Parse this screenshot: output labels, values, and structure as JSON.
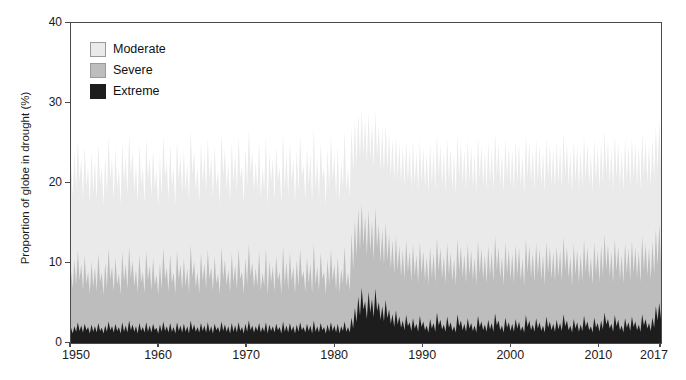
{
  "chart_data": {
    "type": "area",
    "title": "",
    "subtitle": "",
    "xlabel": "",
    "ylabel": "Proportion of globe in drought (%)",
    "xlim": [
      1950,
      2017
    ],
    "ylim": [
      0,
      40
    ],
    "grid": false,
    "legend_position": "top-left inside",
    "stacked": true,
    "yticks": [
      0,
      10,
      20,
      30,
      40
    ],
    "ytick_labels": [
      "0",
      "10",
      "20",
      "30",
      "40"
    ],
    "xticks": [
      1950,
      1960,
      1970,
      1980,
      1990,
      2000,
      2010,
      2017
    ],
    "xtick_labels": [
      "1950",
      "1960",
      "1970",
      "1980",
      "1990",
      "2000",
      "2010",
      "2017"
    ],
    "colors": {
      "moderate": "#eaeaea",
      "severe": "#bdbdbd",
      "extreme": "#1d1d1d",
      "axis": "#4a4a4a",
      "text": "#1a1a1a",
      "background": "#ffffff"
    },
    "legend": [
      {
        "label": "Moderate",
        "color": "#eaeaea"
      },
      {
        "label": "Severe",
        "color": "#bdbdbd"
      },
      {
        "label": "Extreme",
        "color": "#1d1d1d"
      }
    ],
    "series": [
      {
        "name": "Extreme",
        "color": "#1d1d1d",
        "values": [
          1.9,
          1.2,
          2.1,
          1.4,
          2.6,
          1.5,
          2.2,
          1.3,
          2.4,
          1.6,
          2.0,
          1.2,
          2.3,
          1.4,
          2.1,
          1.3,
          2.5,
          1.5,
          1.9,
          1.2,
          2.2,
          1.4,
          2.7,
          1.6,
          2.1,
          1.3,
          2.4,
          1.5,
          2.0,
          1.2,
          2.6,
          1.4,
          2.2,
          1.3,
          2.8,
          1.6,
          2.3,
          1.4,
          2.1,
          1.2,
          2.5,
          1.5,
          2.0,
          1.3,
          2.6,
          1.4,
          2.2,
          1.3,
          2.4,
          1.6,
          1.9,
          1.2,
          2.3,
          1.4,
          2.7,
          1.5,
          2.1,
          1.3,
          2.5,
          1.4,
          2.0,
          1.2,
          2.6,
          1.5,
          2.2,
          1.3,
          2.4,
          1.4,
          2.1,
          1.2,
          2.8,
          1.6,
          2.3,
          1.4,
          2.0,
          1.3,
          2.5,
          1.5,
          2.2,
          1.3,
          2.6,
          1.4,
          2.1,
          1.2,
          2.4,
          1.6,
          2.0,
          1.3,
          2.7,
          1.5,
          2.3,
          1.4,
          2.1,
          1.2,
          2.5,
          1.4,
          2.2,
          1.3,
          2.6,
          1.5,
          2.0,
          1.2,
          2.4,
          1.4,
          2.8,
          1.6,
          2.2,
          1.3,
          2.1,
          1.5,
          2.5,
          1.3,
          2.0,
          1.4,
          2.6,
          1.2,
          2.3,
          1.5,
          2.1,
          1.3,
          2.4,
          1.6,
          2.0,
          1.2,
          2.7,
          1.4,
          2.2,
          1.3,
          2.5,
          1.5,
          2.1,
          1.2,
          2.3,
          1.4,
          2.6,
          1.6,
          2.0,
          1.3,
          2.4,
          1.5,
          2.2,
          1.2,
          2.8,
          1.4,
          2.1,
          1.3,
          2.5,
          1.6,
          2.0,
          1.2,
          2.3,
          1.4,
          2.6,
          1.5,
          2.2,
          1.3,
          2.4,
          1.2,
          2.1,
          1.5,
          2.7,
          1.4,
          2.0,
          1.3,
          3.2,
          1.8,
          4.4,
          2.6,
          5.8,
          3.4,
          6.9,
          4.2,
          5.2,
          3.0,
          6.4,
          3.8,
          5.5,
          3.2,
          6.8,
          4.0,
          5.1,
          2.9,
          4.6,
          2.7,
          5.4,
          3.1,
          4.2,
          2.4,
          3.6,
          2.0,
          4.1,
          2.3,
          3.3,
          1.9,
          2.8,
          1.6,
          3.5,
          2.1,
          2.6,
          1.5,
          3.1,
          1.8,
          2.4,
          1.4,
          3.4,
          2.0,
          2.7,
          1.6,
          2.2,
          1.3,
          3.0,
          1.8,
          2.5,
          1.4,
          3.8,
          2.2,
          2.9,
          1.7,
          2.3,
          1.4,
          3.3,
          1.9,
          2.6,
          1.5,
          2.1,
          1.3,
          3.6,
          2.1,
          2.8,
          1.6,
          2.4,
          1.4,
          3.1,
          1.8,
          2.5,
          1.5,
          2.2,
          1.3,
          3.4,
          2.0,
          2.7,
          1.6,
          2.3,
          1.4,
          2.9,
          1.7,
          2.5,
          1.4,
          3.7,
          2.2,
          2.8,
          1.6,
          2.2,
          1.3,
          3.2,
          1.9,
          2.6,
          1.5,
          2.4,
          1.4,
          3.0,
          1.8,
          2.7,
          1.5,
          2.1,
          1.3,
          3.5,
          2.0,
          2.8,
          1.6,
          2.3,
          1.4,
          3.1,
          1.8,
          2.6,
          1.5,
          2.2,
          1.3,
          3.3,
          1.9,
          2.7,
          1.6,
          2.4,
          1.4,
          2.9,
          1.7,
          2.5,
          1.5,
          3.6,
          2.1,
          2.8,
          1.6,
          2.2,
          1.3,
          3.0,
          1.8,
          2.6,
          1.4,
          2.3,
          1.5,
          3.4,
          2.0,
          2.7,
          1.6,
          2.1,
          1.3,
          3.2,
          1.9,
          2.5,
          1.4,
          2.8,
          1.7,
          3.8,
          2.3,
          3.0,
          1.8,
          2.4,
          1.4,
          3.5,
          2.1,
          2.9,
          1.6,
          2.2,
          1.3,
          3.1,
          1.9,
          2.6,
          1.5,
          3.3,
          2.0,
          2.7,
          1.6,
          2.3,
          1.4,
          3.6,
          2.2,
          3.0,
          1.8,
          2.5,
          1.5,
          3.2,
          1.9,
          4.6,
          2.8,
          5.0,
          3.0
        ]
      },
      {
        "name": "Severe",
        "color": "#bdbdbd",
        "values": [
          9.1,
          6.8,
          10.4,
          7.2,
          11.6,
          7.8,
          9.8,
          6.6,
          10.9,
          7.4,
          8.9,
          6.2,
          10.2,
          7.0,
          9.5,
          6.5,
          11.2,
          7.6,
          8.8,
          6.0,
          10.1,
          6.9,
          11.8,
          7.9,
          9.6,
          6.4,
          10.7,
          7.3,
          8.7,
          6.1,
          11.4,
          7.7,
          9.9,
          6.7,
          12.1,
          8.1,
          10.3,
          7.1,
          9.2,
          6.3,
          11.0,
          7.5,
          8.9,
          6.2,
          11.5,
          7.8,
          9.7,
          6.6,
          10.6,
          7.2,
          8.6,
          6.0,
          10.0,
          6.8,
          11.9,
          8.0,
          9.4,
          6.4,
          11.1,
          7.5,
          8.8,
          6.1,
          11.6,
          7.9,
          9.8,
          6.7,
          10.5,
          7.1,
          9.3,
          6.3,
          12.3,
          8.2,
          10.2,
          7.0,
          8.9,
          6.2,
          11.3,
          7.7,
          9.9,
          6.8,
          11.7,
          7.9,
          9.5,
          6.5,
          10.8,
          7.4,
          8.7,
          6.1,
          12.0,
          8.0,
          10.4,
          7.2,
          9.2,
          6.3,
          11.2,
          7.6,
          9.8,
          6.7,
          11.8,
          8.0,
          8.9,
          6.2,
          10.6,
          7.3,
          12.4,
          8.3,
          10.1,
          6.9,
          9.4,
          7.0,
          11.5,
          6.5,
          8.8,
          7.1,
          11.9,
          6.0,
          10.3,
          7.6,
          9.6,
          6.4,
          10.9,
          7.8,
          8.9,
          6.1,
          12.2,
          7.2,
          10.2,
          6.6,
          11.4,
          7.7,
          9.5,
          6.2,
          10.4,
          7.1,
          11.8,
          8.1,
          9.0,
          6.4,
          10.7,
          7.5,
          9.9,
          6.2,
          12.5,
          7.3,
          9.6,
          6.5,
          11.3,
          8.0,
          8.9,
          6.1,
          10.5,
          7.2,
          11.7,
          7.8,
          9.8,
          6.6,
          10.8,
          6.3,
          9.3,
          7.4,
          12.1,
          7.1,
          8.8,
          6.5,
          13.8,
          9.2,
          15.4,
          10.8,
          16.8,
          11.6,
          17.4,
          12.2,
          15.9,
          10.9,
          16.6,
          11.4,
          15.2,
          10.4,
          16.9,
          11.8,
          14.8,
          10.1,
          14.2,
          9.8,
          15.0,
          10.3,
          13.6,
          9.3,
          12.8,
          8.6,
          13.4,
          9.1,
          12.2,
          8.3,
          11.6,
          7.9,
          12.9,
          8.8,
          11.4,
          7.7,
          12.3,
          8.4,
          11.0,
          7.5,
          12.6,
          8.6,
          11.5,
          7.8,
          10.8,
          7.3,
          12.0,
          8.2,
          11.2,
          7.6,
          13.2,
          9.0,
          11.9,
          8.1,
          10.9,
          7.4,
          12.5,
          8.5,
          11.3,
          7.7,
          10.6,
          7.2,
          13.0,
          8.9,
          12.1,
          8.2,
          11.1,
          7.5,
          12.4,
          8.4,
          11.6,
          7.9,
          10.7,
          7.3,
          12.8,
          8.7,
          11.8,
          8.0,
          11.0,
          7.4,
          12.2,
          8.3,
          11.4,
          7.6,
          13.4,
          9.1,
          12.0,
          8.1,
          10.8,
          7.2,
          12.6,
          8.6,
          11.7,
          7.9,
          11.2,
          7.5,
          12.3,
          8.4,
          11.9,
          7.8,
          10.6,
          7.1,
          13.1,
          8.8,
          12.2,
          8.2,
          11.3,
          7.6,
          12.5,
          8.5,
          11.8,
          7.9,
          11.0,
          7.3,
          12.7,
          8.7,
          11.9,
          8.0,
          11.4,
          7.7,
          12.1,
          8.3,
          11.6,
          7.8,
          13.3,
          9.0,
          12.0,
          8.1,
          10.9,
          7.2,
          12.4,
          8.5,
          11.7,
          7.5,
          11.2,
          7.8,
          12.9,
          8.8,
          12.0,
          8.0,
          10.8,
          7.3,
          12.6,
          8.6,
          11.5,
          7.6,
          12.2,
          8.4,
          13.6,
          9.2,
          12.3,
          8.3,
          11.4,
          7.5,
          13.0,
          8.9,
          12.1,
          7.9,
          11.1,
          7.4,
          12.5,
          8.6,
          11.8,
          7.8,
          12.8,
          8.7,
          12.0,
          8.1,
          11.5,
          7.6,
          13.4,
          9.1,
          12.4,
          8.4,
          11.9,
          7.9,
          12.7,
          8.6,
          14.2,
          9.6,
          14.8,
          10.0
        ]
      },
      {
        "name": "Moderate",
        "color": "#eaeaea",
        "values": [
          22.6,
          18.4,
          24.1,
          19.2,
          25.4,
          20.1,
          23.2,
          18.0,
          24.6,
          19.6,
          22.1,
          17.4,
          23.9,
          18.8,
          22.8,
          17.8,
          25.0,
          19.8,
          21.9,
          17.2,
          23.6,
          18.6,
          25.8,
          20.4,
          23.0,
          17.9,
          24.4,
          19.4,
          21.8,
          17.3,
          25.2,
          20.0,
          23.4,
          18.5,
          26.2,
          20.8,
          24.0,
          19.0,
          22.4,
          17.6,
          24.8,
          19.7,
          22.0,
          17.4,
          25.6,
          20.2,
          23.3,
          18.3,
          24.3,
          19.3,
          21.6,
          17.1,
          23.5,
          18.4,
          26.0,
          20.6,
          22.7,
          17.8,
          24.9,
          19.6,
          21.9,
          17.2,
          25.5,
          20.3,
          23.6,
          18.7,
          24.2,
          19.1,
          22.6,
          17.7,
          26.6,
          21.0,
          24.1,
          19.0,
          22.0,
          17.5,
          25.1,
          19.9,
          23.7,
          18.8,
          25.7,
          20.4,
          23.2,
          18.2,
          24.7,
          19.5,
          21.8,
          17.3,
          26.4,
          20.9,
          24.3,
          19.2,
          22.5,
          17.6,
          25.2,
          20.0,
          23.8,
          18.8,
          25.9,
          20.5,
          22.1,
          17.4,
          24.4,
          19.4,
          26.8,
          21.2,
          23.9,
          18.9,
          22.8,
          19.0,
          25.4,
          18.1,
          21.9,
          19.2,
          26.1,
          17.0,
          24.0,
          20.0,
          23.1,
          17.9,
          24.6,
          20.2,
          22.0,
          17.3,
          26.5,
          19.1,
          24.0,
          18.3,
          25.3,
          20.1,
          23.0,
          17.5,
          24.2,
          19.0,
          26.0,
          20.7,
          22.3,
          17.8,
          24.5,
          19.7,
          23.7,
          17.6,
          27.0,
          19.2,
          23.2,
          18.0,
          25.1,
          20.5,
          22.0,
          17.2,
          24.3,
          19.1,
          25.8,
          20.3,
          23.6,
          18.4,
          24.6,
          17.7,
          22.7,
          19.4,
          26.5,
          19.0,
          21.9,
          18.2,
          26.9,
          21.4,
          27.8,
          22.2,
          28.6,
          22.9,
          29.2,
          23.4,
          28.1,
          22.4,
          28.8,
          23.0,
          27.6,
          22.0,
          29.0,
          23.2,
          27.2,
          21.6,
          26.8,
          21.3,
          27.4,
          21.8,
          26.2,
          20.8,
          25.6,
          20.2,
          26.0,
          20.6,
          25.1,
          19.9,
          24.6,
          19.5,
          25.4,
          20.1,
          24.4,
          19.3,
          25.2,
          19.8,
          24.0,
          19.0,
          25.5,
          20.0,
          24.5,
          19.4,
          23.8,
          18.8,
          25.0,
          19.7,
          24.2,
          19.2,
          26.2,
          20.7,
          24.9,
          19.6,
          23.9,
          18.9,
          25.6,
          20.2,
          24.3,
          19.3,
          23.6,
          18.6,
          26.0,
          20.6,
          25.1,
          19.8,
          24.1,
          19.1,
          25.4,
          20.0,
          24.6,
          19.5,
          23.7,
          18.7,
          25.8,
          20.4,
          24.8,
          19.6,
          24.0,
          19.0,
          25.2,
          19.9,
          24.4,
          19.2,
          26.4,
          20.8,
          25.0,
          19.7,
          23.8,
          18.8,
          25.6,
          20.3,
          24.7,
          19.5,
          24.2,
          19.1,
          25.3,
          20.0,
          24.9,
          19.6,
          23.6,
          18.6,
          26.1,
          20.6,
          25.2,
          19.9,
          24.3,
          19.2,
          25.5,
          20.1,
          24.8,
          19.6,
          24.0,
          18.9,
          25.7,
          20.3,
          24.9,
          19.7,
          24.4,
          19.3,
          25.1,
          19.8,
          24.6,
          19.4,
          26.3,
          20.8,
          25.0,
          19.7,
          23.9,
          18.8,
          25.4,
          20.1,
          24.7,
          19.1,
          24.2,
          19.4,
          25.9,
          20.5,
          25.0,
          19.7,
          23.8,
          18.9,
          25.6,
          20.2,
          24.5,
          19.2,
          25.2,
          20.0,
          26.6,
          21.0,
          25.3,
          19.9,
          24.4,
          19.1,
          26.0,
          20.6,
          25.1,
          19.5,
          24.1,
          19.0,
          25.5,
          20.2,
          24.8,
          19.4,
          25.8,
          20.4,
          25.0,
          19.7,
          24.5,
          19.2,
          26.4,
          20.9,
          25.4,
          20.0,
          24.9,
          19.5,
          25.7,
          20.3,
          27.2,
          21.4,
          27.8,
          21.8
        ]
      }
    ]
  }
}
